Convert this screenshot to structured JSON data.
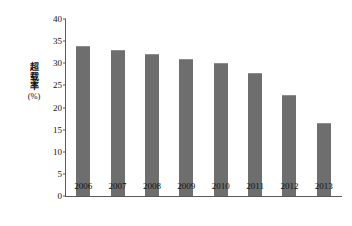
{
  "chart_data": {
    "type": "bar",
    "title": "",
    "subtitle": "",
    "categories": [
      "2006",
      "2007",
      "2008",
      "2009",
      "2010",
      "2011",
      "2012",
      "2013"
    ],
    "values": [
      34,
      33,
      32,
      31,
      30,
      27.8,
      22.8,
      16.5
    ],
    "series": [
      {
        "name": "超载率",
        "values": [
          34,
          33,
          32,
          31,
          30,
          27.8,
          22.8,
          16.5
        ]
      }
    ],
    "xlabel": "",
    "ylabel": "超载率(%)",
    "ylabel_chars": [
      "超",
      "载",
      "率"
    ],
    "ylabel_unit": "(%)",
    "ylim": [
      0,
      40
    ],
    "yticks": [
      0,
      5,
      10,
      15,
      20,
      25,
      30,
      35,
      40
    ],
    "ytick_labels": [
      "0",
      "5",
      "10",
      "15",
      "20",
      "25",
      "30",
      "35",
      "40"
    ],
    "grid": false,
    "legend": false,
    "legend_position": "none",
    "bar_color": "#6e6e6e",
    "axis_color": "#5a5a5a",
    "background_color": "#ffffff",
    "text_color": "#111111"
  }
}
